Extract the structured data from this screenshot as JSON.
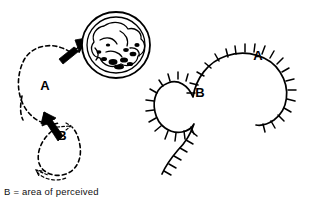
{
  "figure": {
    "title": "",
    "caption": "B = area of perceived",
    "panels": [
      {
        "id": "left-panel",
        "name": "dashed-loop-diagram",
        "style": "dashed",
        "labels": [
          {
            "text": "A",
            "x": 45,
            "y": 90
          },
          {
            "text": "B",
            "x": 62,
            "y": 140
          }
        ],
        "arrows": [
          {
            "name": "arrow-upper",
            "direction": "up-right",
            "x": 72,
            "y": 48
          },
          {
            "name": "arrow-lower",
            "direction": "up-left",
            "x": 52,
            "y": 122
          }
        ],
        "blob": {
          "name": "round-mass",
          "cx": 116,
          "cy": 45,
          "rx": 34,
          "ry": 33
        }
      },
      {
        "id": "right-panel",
        "name": "hatched-loop-diagram",
        "style": "hatched",
        "labels": [
          {
            "text": "A",
            "x": 258,
            "y": 60
          },
          {
            "text": "B",
            "x": 200,
            "y": 97
          }
        ]
      }
    ]
  },
  "colors": {
    "ink": "#000000",
    "background": "#ffffff"
  }
}
